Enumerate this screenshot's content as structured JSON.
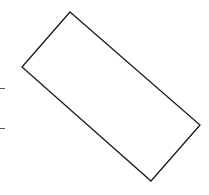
{
  "diagram": {
    "background": "#ffffff",
    "stroke_color": "#1a1a1a",
    "shapes": [
      {
        "type": "rotated-rectangle",
        "points": [
          [
            70,
            12
          ],
          [
            200,
            125
          ],
          [
            151,
            181
          ],
          [
            22,
            67
          ]
        ]
      }
    ],
    "marks": [
      {
        "type": "tick",
        "x1": 0,
        "y1": 88,
        "x2": 5,
        "y2": 88
      },
      {
        "type": "tick",
        "x1": 0,
        "y1": 128,
        "x2": 5,
        "y2": 128
      }
    ]
  }
}
